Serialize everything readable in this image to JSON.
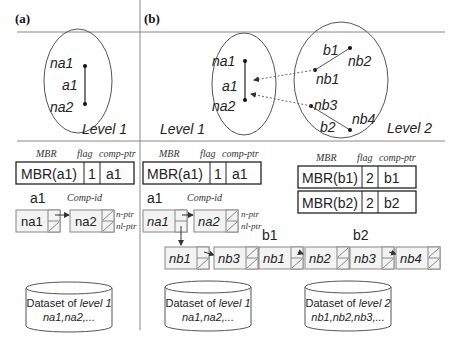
{
  "panels": {
    "a": {
      "label": "(a)"
    },
    "b": {
      "label": "(b)"
    }
  },
  "level1": {
    "label": "Level 1",
    "object": "a1",
    "nodes": [
      "na1",
      "na2"
    ]
  },
  "level2": {
    "label": "Level 2",
    "objects": [
      {
        "name": "b1",
        "nodes": [
          "nb1",
          "nb2"
        ]
      },
      {
        "name": "b2",
        "nodes": [
          "nb3",
          "nb4"
        ]
      }
    ]
  },
  "index_header": {
    "mbr": "MBR",
    "flag": "flag",
    "comp_ptr": "comp-ptr"
  },
  "index_entries_level1": [
    {
      "mbr": "MBR(a1)",
      "flag": "1",
      "comp": "a1"
    }
  ],
  "index_entries_level2": [
    {
      "mbr": "MBR(b1)",
      "flag": "2",
      "comp": "b1"
    },
    {
      "mbr": "MBR(b2)",
      "flag": "2",
      "comp": "b2"
    }
  ],
  "component_lists": {
    "a1": {
      "title": "a1",
      "comp_id_label": "Comp-id",
      "nodes": [
        "na1",
        "na2"
      ]
    },
    "a1_children": {
      "nodes": [
        "nb1",
        "nb3"
      ]
    },
    "b1": {
      "title": "b1",
      "nodes": [
        "nb1",
        "nb2"
      ]
    },
    "b2": {
      "title": "b2",
      "nodes": [
        "nb3",
        "nb4"
      ]
    }
  },
  "pointer_labels": {
    "n_ptr": "n-ptr",
    "nl_ptr": "nl-ptr"
  },
  "datasets": [
    {
      "line1_prefix": "Dataset of ",
      "line1_level": "level 1",
      "line2": "na1,na2,..."
    },
    {
      "line1_prefix": "Dataset of ",
      "line1_level": "level 1",
      "line2": "na1,na2,..."
    },
    {
      "line1_prefix": "Dataset of ",
      "line1_level": "level 2",
      "line2": "nb1,nb2,nb3,..."
    }
  ]
}
